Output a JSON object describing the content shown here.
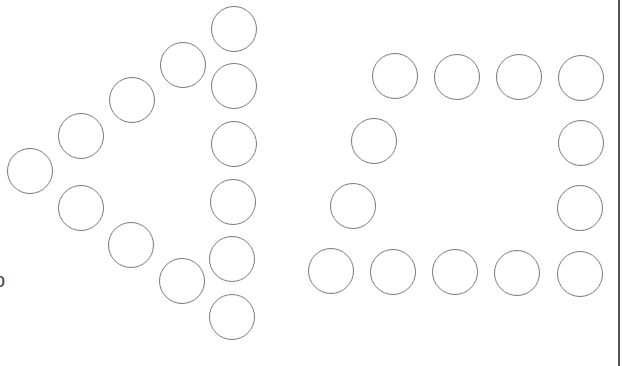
{
  "figure": {
    "circle_radius": 23,
    "stroke_color": "#7a7a7a",
    "background": "#ffffff",
    "edge_glyph": "o",
    "left_shape": {
      "name": "arrow",
      "circles": [
        {
          "x": 234,
          "y": 29
        },
        {
          "x": 234,
          "y": 86
        },
        {
          "x": 234,
          "y": 144
        },
        {
          "x": 233,
          "y": 202
        },
        {
          "x": 232,
          "y": 259
        },
        {
          "x": 232,
          "y": 317
        },
        {
          "x": 183,
          "y": 65
        },
        {
          "x": 132,
          "y": 100
        },
        {
          "x": 81,
          "y": 136
        },
        {
          "x": 30,
          "y": 171
        },
        {
          "x": 81,
          "y": 208
        },
        {
          "x": 131,
          "y": 245
        },
        {
          "x": 182,
          "y": 281
        }
      ]
    },
    "right_shape": {
      "name": "bracket",
      "circles": [
        {
          "x": 395,
          "y": 76
        },
        {
          "x": 457,
          "y": 77
        },
        {
          "x": 519,
          "y": 77
        },
        {
          "x": 581,
          "y": 78
        },
        {
          "x": 374,
          "y": 141
        },
        {
          "x": 581,
          "y": 143
        },
        {
          "x": 353,
          "y": 206
        },
        {
          "x": 580,
          "y": 208
        },
        {
          "x": 331,
          "y": 271
        },
        {
          "x": 393,
          "y": 272
        },
        {
          "x": 455,
          "y": 272
        },
        {
          "x": 517,
          "y": 273
        },
        {
          "x": 580,
          "y": 274
        }
      ]
    }
  }
}
